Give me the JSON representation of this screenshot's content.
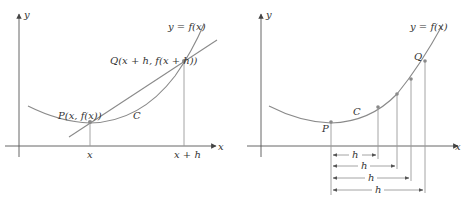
{
  "left_panel": {
    "axis_labels": {
      "x": "x",
      "y": "y"
    },
    "curve_label": "y = f(x)",
    "curve_name": "C",
    "point_p": "P(x, f(x))",
    "point_q": "Q(x + h, f(x + h))",
    "tick_x": "x",
    "tick_x_plus_h": "x + h"
  },
  "right_panel": {
    "axis_labels": {
      "x": "x",
      "y": "y"
    },
    "curve_label": "y = f(x)",
    "curve_name": "C",
    "point_p": "P",
    "point_q": "Q",
    "h_labels": [
      "h",
      "h",
      "h",
      "h"
    ]
  },
  "colors": {
    "curve": "#8a8a8a",
    "axis": "#555555",
    "text": "#333333"
  }
}
